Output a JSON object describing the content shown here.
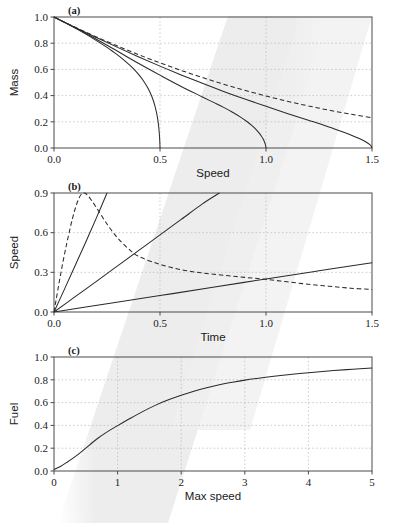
{
  "figure": {
    "background": "#ffffff",
    "ink_color": "#2b2b2b",
    "grid_color": "#b9b9b9",
    "frame_color": "#4a4a4a",
    "smudge_color": "#e9e9e9",
    "smudge_label": "diagonal-gray-scan-band"
  },
  "chart_data": [
    {
      "type": "line",
      "panel": "(a)",
      "title": "",
      "xlabel": "Speed",
      "ylabel": "Mass",
      "xlim": [
        0.0,
        1.5
      ],
      "ylim": [
        0.0,
        1.0
      ],
      "xticks": [
        0.0,
        0.5,
        1.0,
        1.5
      ],
      "xtick_labels": [
        "0.0",
        "0.5",
        "1.0",
        "1.5"
      ],
      "yticks": [
        0.0,
        0.2,
        0.4,
        0.6,
        0.8,
        1.0
      ],
      "ytick_labels": [
        "0.0",
        "0.2",
        "0.4",
        "0.6",
        "0.8",
        "1.0"
      ],
      "grid": true,
      "legend": "none",
      "series": [
        {
          "name": "mass-vmax-0.5",
          "style": "solid",
          "points": [
            [
              0.0,
              1.0
            ],
            [
              0.05,
              0.958
            ],
            [
              0.1,
              0.915
            ],
            [
              0.15,
              0.869
            ],
            [
              0.2,
              0.82
            ],
            [
              0.25,
              0.768
            ],
            [
              0.28,
              0.734
            ],
            [
              0.31,
              0.698
            ],
            [
              0.34,
              0.658
            ],
            [
              0.36,
              0.629
            ],
            [
              0.38,
              0.597
            ],
            [
              0.4,
              0.56
            ],
            [
              0.42,
              0.517
            ],
            [
              0.44,
              0.465
            ],
            [
              0.455,
              0.418
            ],
            [
              0.465,
              0.378
            ],
            [
              0.475,
              0.328
            ],
            [
              0.483,
              0.275
            ],
            [
              0.489,
              0.222
            ],
            [
              0.493,
              0.174
            ],
            [
              0.496,
              0.126
            ],
            [
              0.498,
              0.08
            ],
            [
              0.4995,
              0.035
            ],
            [
              0.5,
              0.0
            ]
          ]
        },
        {
          "name": "mass-vmax-1.0",
          "style": "solid",
          "points": [
            [
              0.0,
              1.0
            ],
            [
              0.1,
              0.918
            ],
            [
              0.2,
              0.83
            ],
            [
              0.3,
              0.738
            ],
            [
              0.4,
              0.645
            ],
            [
              0.5,
              0.556
            ],
            [
              0.6,
              0.47
            ],
            [
              0.7,
              0.39
            ],
            [
              0.75,
              0.35
            ],
            [
              0.8,
              0.31
            ],
            [
              0.84,
              0.275
            ],
            [
              0.88,
              0.236
            ],
            [
              0.91,
              0.202
            ],
            [
              0.93,
              0.176
            ],
            [
              0.95,
              0.146
            ],
            [
              0.965,
              0.119
            ],
            [
              0.977,
              0.094
            ],
            [
              0.986,
              0.07
            ],
            [
              0.992,
              0.05
            ],
            [
              0.996,
              0.032
            ],
            [
              0.999,
              0.014
            ],
            [
              1.0,
              0.0
            ]
          ]
        },
        {
          "name": "mass-vmax-1.5",
          "style": "solid",
          "points": [
            [
              0.0,
              1.0
            ],
            [
              0.1,
              0.92
            ],
            [
              0.2,
              0.843
            ],
            [
              0.3,
              0.768
            ],
            [
              0.4,
              0.695
            ],
            [
              0.5,
              0.625
            ],
            [
              0.6,
              0.558
            ],
            [
              0.7,
              0.494
            ],
            [
              0.8,
              0.432
            ],
            [
              0.9,
              0.374
            ],
            [
              1.0,
              0.318
            ],
            [
              1.1,
              0.264
            ],
            [
              1.2,
              0.212
            ],
            [
              1.28,
              0.17
            ],
            [
              1.35,
              0.13
            ],
            [
              1.4,
              0.1
            ],
            [
              1.44,
              0.072
            ],
            [
              1.47,
              0.048
            ],
            [
              1.49,
              0.026
            ],
            [
              1.498,
              0.01
            ],
            [
              1.5,
              0.0
            ]
          ]
        },
        {
          "name": "mass-asymptotic-dashed",
          "style": "dashed",
          "points": [
            [
              0.0,
              1.0
            ],
            [
              0.1,
              0.922
            ],
            [
              0.2,
              0.848
            ],
            [
              0.3,
              0.778
            ],
            [
              0.4,
              0.712
            ],
            [
              0.5,
              0.65
            ],
            [
              0.6,
              0.592
            ],
            [
              0.7,
              0.538
            ],
            [
              0.8,
              0.487
            ],
            [
              0.9,
              0.44
            ],
            [
              1.0,
              0.397
            ],
            [
              1.1,
              0.357
            ],
            [
              1.2,
              0.321
            ],
            [
              1.3,
              0.288
            ],
            [
              1.4,
              0.258
            ],
            [
              1.5,
              0.231
            ]
          ]
        }
      ]
    },
    {
      "type": "line",
      "panel": "(b)",
      "title": "",
      "xlabel": "Time",
      "ylabel": "Speed",
      "xlim": [
        0.0,
        1.5
      ],
      "ylim": [
        0.0,
        0.9
      ],
      "xticks": [
        0.0,
        0.5,
        1.0,
        1.5
      ],
      "xtick_labels": [
        "0.0",
        "0.5",
        "1.0",
        "1.5"
      ],
      "yticks": [
        0.0,
        0.3,
        0.6,
        0.9
      ],
      "ytick_labels": [
        "0.0",
        "0.3",
        "0.6",
        "0.9"
      ],
      "grid": true,
      "legend": "none",
      "series": [
        {
          "name": "speed-steep-solid",
          "style": "solid",
          "points": [
            [
              0.0,
              0.0
            ],
            [
              0.05,
              0.175
            ],
            [
              0.1,
              0.352
            ],
            [
              0.15,
              0.53
            ],
            [
              0.2,
              0.712
            ],
            [
              0.25,
              0.9
            ]
          ]
        },
        {
          "name": "speed-medium-solid",
          "style": "solid",
          "points": [
            [
              0.0,
              0.0
            ],
            [
              0.1,
              0.116
            ],
            [
              0.2,
              0.232
            ],
            [
              0.3,
              0.349
            ],
            [
              0.4,
              0.466
            ],
            [
              0.5,
              0.583
            ],
            [
              0.6,
              0.7
            ],
            [
              0.7,
              0.818
            ],
            [
              0.78,
              0.9
            ]
          ]
        },
        {
          "name": "speed-shallow-solid",
          "style": "solid",
          "points": [
            [
              0.0,
              0.0
            ],
            [
              0.25,
              0.062
            ],
            [
              0.5,
              0.124
            ],
            [
              0.75,
              0.187
            ],
            [
              1.0,
              0.25
            ],
            [
              1.25,
              0.312
            ],
            [
              1.5,
              0.372
            ]
          ]
        },
        {
          "name": "speed-peaked-dashed",
          "style": "dashed",
          "points": [
            [
              0.0,
              0.0
            ],
            [
              0.04,
              0.36
            ],
            [
              0.08,
              0.66
            ],
            [
              0.11,
              0.83
            ],
            [
              0.135,
              0.9
            ],
            [
              0.16,
              0.88
            ],
            [
              0.2,
              0.79
            ],
            [
              0.25,
              0.665
            ],
            [
              0.3,
              0.56
            ],
            [
              0.35,
              0.48
            ],
            [
              0.4,
              0.42
            ],
            [
              0.5,
              0.36
            ],
            [
              0.6,
              0.32
            ],
            [
              0.7,
              0.295
            ],
            [
              0.8,
              0.278
            ],
            [
              0.9,
              0.262
            ],
            [
              1.0,
              0.247
            ],
            [
              1.1,
              0.228
            ],
            [
              1.2,
              0.21
            ],
            [
              1.3,
              0.194
            ],
            [
              1.4,
              0.18
            ],
            [
              1.5,
              0.17
            ]
          ]
        }
      ]
    },
    {
      "type": "line",
      "panel": "(c)",
      "title": "",
      "xlabel": "Max speed",
      "ylabel": "Fuel",
      "xlim": [
        0,
        5
      ],
      "ylim": [
        0.0,
        1.0
      ],
      "xticks": [
        0,
        1,
        2,
        3,
        4,
        5
      ],
      "xtick_labels": [
        "0",
        "1",
        "2",
        "3",
        "4",
        "5"
      ],
      "yticks": [
        0.0,
        0.2,
        0.4,
        0.6,
        0.8,
        1.0
      ],
      "ytick_labels": [
        "0.0",
        "0.2",
        "0.4",
        "0.6",
        "0.8",
        "1.0"
      ],
      "grid": true,
      "legend": "none",
      "series": [
        {
          "name": "fuel-vs-max-speed",
          "style": "solid",
          "points": [
            [
              0.0,
              0.012
            ],
            [
              0.1,
              0.04
            ],
            [
              0.2,
              0.075
            ],
            [
              0.3,
              0.113
            ],
            [
              0.4,
              0.155
            ],
            [
              0.5,
              0.2
            ],
            [
              0.6,
              0.248
            ],
            [
              0.7,
              0.292
            ],
            [
              0.8,
              0.33
            ],
            [
              0.9,
              0.365
            ],
            [
              1.0,
              0.398
            ],
            [
              1.2,
              0.462
            ],
            [
              1.4,
              0.523
            ],
            [
              1.6,
              0.578
            ],
            [
              1.8,
              0.624
            ],
            [
              2.0,
              0.664
            ],
            [
              2.2,
              0.7
            ],
            [
              2.4,
              0.73
            ],
            [
              2.6,
              0.756
            ],
            [
              2.8,
              0.778
            ],
            [
              3.0,
              0.797
            ],
            [
              3.3,
              0.82
            ],
            [
              3.6,
              0.84
            ],
            [
              4.0,
              0.862
            ],
            [
              4.4,
              0.881
            ],
            [
              4.7,
              0.893
            ],
            [
              5.0,
              0.903
            ]
          ]
        }
      ]
    }
  ]
}
